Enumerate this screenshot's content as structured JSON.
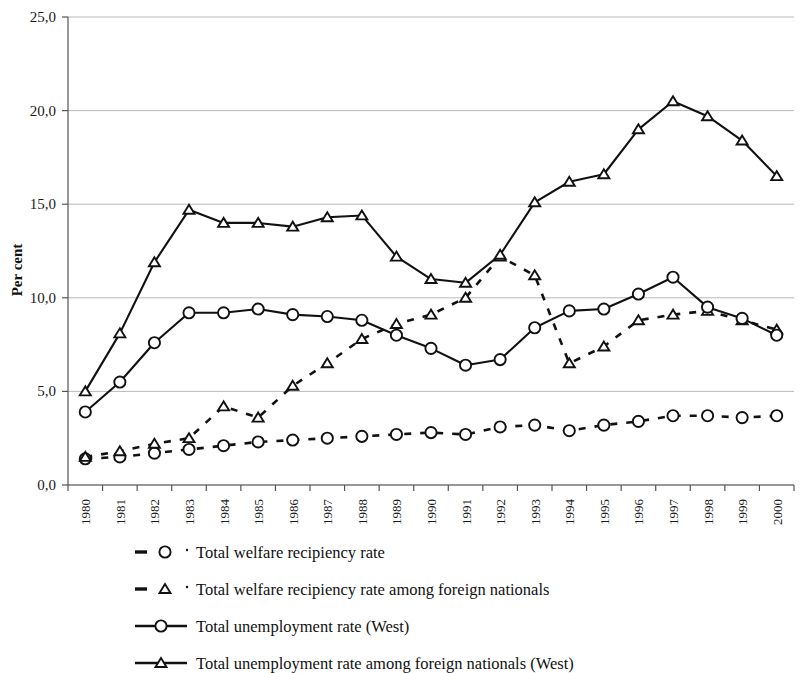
{
  "chart_data": {
    "type": "line",
    "title": "",
    "xlabel": "",
    "ylabel": "Per cent",
    "ylim": [
      0,
      25
    ],
    "ytick_labels": [
      "0,0",
      "5,0",
      "10,0",
      "15,0",
      "20,0",
      "25,0"
    ],
    "ytick_values": [
      0,
      5,
      10,
      15,
      20,
      25
    ],
    "grid": true,
    "legend_position": "bottom",
    "categories": [
      "1980",
      "1981",
      "1982",
      "1983",
      "1984",
      "1985",
      "1986",
      "1987",
      "1988",
      "1989",
      "1990",
      "1991",
      "1992",
      "1993",
      "1994",
      "1995",
      "1996",
      "1997",
      "1998",
      "1999",
      "2000"
    ],
    "series": [
      {
        "name": "Total welfare recipiency rate",
        "style": "dashed",
        "marker": "circle",
        "values": [
          1.4,
          1.5,
          1.7,
          1.9,
          2.1,
          2.3,
          2.4,
          2.5,
          2.6,
          2.7,
          2.8,
          2.7,
          3.1,
          3.2,
          2.9,
          3.2,
          3.4,
          3.7,
          3.7,
          3.6,
          3.7
        ]
      },
      {
        "name": "Total welfare recipiency rate among foreign nationals",
        "style": "dashed",
        "marker": "triangle",
        "values": [
          1.5,
          1.8,
          2.2,
          2.5,
          4.2,
          3.6,
          5.3,
          6.5,
          7.8,
          8.6,
          9.1,
          10.0,
          12.2,
          11.2,
          6.5,
          7.4,
          8.8,
          9.1,
          9.3,
          8.8,
          8.3
        ]
      },
      {
        "name": "Total unemployment rate (West)",
        "style": "solid",
        "marker": "circle",
        "values": [
          3.9,
          5.5,
          7.6,
          9.2,
          9.2,
          9.4,
          9.1,
          9.0,
          8.8,
          8.0,
          7.3,
          6.4,
          6.7,
          8.4,
          9.3,
          9.4,
          10.2,
          11.1,
          9.5,
          8.9,
          8.0
        ]
      },
      {
        "name": "Total unemployment rate among foreign nationals (West)",
        "style": "solid",
        "marker": "triangle",
        "values": [
          5.0,
          8.1,
          11.9,
          14.7,
          14.0,
          14.0,
          13.8,
          14.3,
          14.4,
          12.2,
          11.0,
          10.8,
          12.3,
          15.1,
          16.2,
          16.6,
          19.0,
          20.5,
          19.7,
          18.4,
          16.5
        ]
      }
    ]
  },
  "legend": {
    "items": [
      {
        "label": "Total welfare recipiency rate",
        "style": "dashed",
        "marker": "circle"
      },
      {
        "label": "Total welfare recipiency rate among foreign nationals",
        "style": "dashed",
        "marker": "triangle"
      },
      {
        "label": "Total unemployment rate (West)",
        "style": "solid",
        "marker": "circle"
      },
      {
        "label": "Total unemployment rate among foreign nationals (West)",
        "style": "solid",
        "marker": "triangle"
      }
    ]
  },
  "colors": {
    "ink": "#111111",
    "grid": "#b9b9b9",
    "axis": "#555555",
    "background": "#ffffff"
  }
}
